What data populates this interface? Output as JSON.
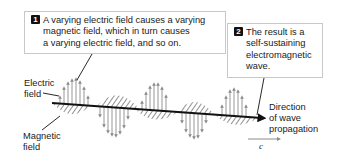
{
  "callouts": [
    {
      "number": "1",
      "lines": [
        "A varying electric field causes a varying",
        "magnetic field, which in turn causes",
        "a varying electric field, and so on."
      ]
    },
    {
      "number": "2",
      "lines": [
        "The result is a",
        "self-sustaining",
        "electromagnetic",
        "wave."
      ]
    }
  ],
  "labels": {
    "electric_field": [
      "Electric",
      "field"
    ],
    "magnetic_field": [
      "Magnetic",
      "field"
    ],
    "propagation": [
      "Direction",
      "of wave",
      "propagation"
    ],
    "speed": "c"
  },
  "colors": {
    "line": "#111111",
    "arrow": "#8a8a8a",
    "hatch": "#555555",
    "border": "#c8c8c8"
  }
}
